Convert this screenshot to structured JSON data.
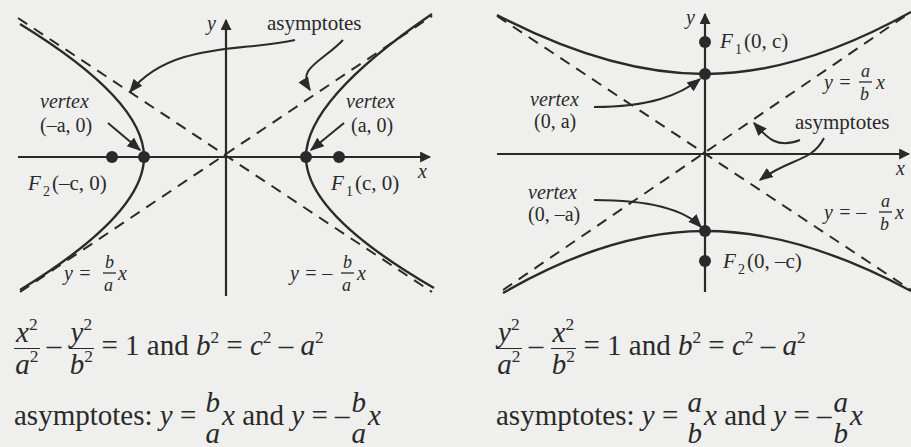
{
  "left_diagram": {
    "axis_x": "x",
    "axis_y": "y",
    "callout": "asymptotes",
    "vertex_left": {
      "label": "vertex",
      "coords": "(–a, 0)"
    },
    "vertex_right": {
      "label": "vertex",
      "coords": "(a, 0)"
    },
    "focus_left": {
      "name": "F",
      "sub": "2",
      "coords": "(–c, 0)"
    },
    "focus_right": {
      "name": "F",
      "sub": "1",
      "coords": "(c, 0)"
    },
    "asymptote_pos": {
      "lhs": "y =",
      "num": "b",
      "den": "a",
      "var": "x"
    },
    "asymptote_neg": {
      "lhs": "y = –",
      "num": "b",
      "den": "a",
      "var": "x"
    },
    "equation": {
      "t1_num": "x",
      "t1_den": "a",
      "t2_num": "y",
      "t2_den": "b",
      "rhs": "= 1 and",
      "b": "b",
      "eq": "=",
      "c": "c",
      "minus": "–",
      "a": "a",
      "exp": "2"
    },
    "asym_text": {
      "prefix": "asymptotes:",
      "y1": "y",
      "eq": "=",
      "num": "b",
      "den": "a",
      "x": "x",
      "and": "and",
      "neg": "–"
    }
  },
  "right_diagram": {
    "axis_x": "x",
    "axis_y": "y",
    "callout": "asymptotes",
    "vertex_top": {
      "label": "vertex",
      "coords": "(0, a)"
    },
    "vertex_bottom": {
      "label": "vertex",
      "coords": "(0, –a)"
    },
    "focus_top": {
      "name": "F",
      "sub": "1",
      "coords": "(0, c)"
    },
    "focus_bottom": {
      "name": "F",
      "sub": "2",
      "coords": "(0, –c)"
    },
    "asymptote_pos": {
      "lhs": "y =",
      "num": "a",
      "den": "b",
      "var": "x"
    },
    "asymptote_neg": {
      "lhs": "y = –",
      "num": "a",
      "den": "b",
      "var": "x"
    },
    "equation": {
      "t1_num": "y",
      "t1_den": "a",
      "t2_num": "x",
      "t2_den": "b",
      "rhs": "= 1 and",
      "b": "b",
      "eq": "=",
      "c": "c",
      "minus": "–",
      "a": "a",
      "exp": "2"
    },
    "asym_text": {
      "prefix": "asymptotes:",
      "y1": "y",
      "eq": "=",
      "num": "a",
      "den": "b",
      "x": "x",
      "and": "and",
      "neg": "–"
    }
  },
  "colors": {
    "background": "#efefed",
    "ink": "#2a2a2a"
  }
}
